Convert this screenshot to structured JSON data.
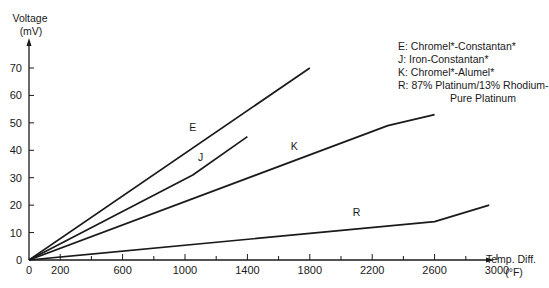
{
  "chart_data": {
    "type": "line",
    "title": "",
    "xlabel": "Temp. Diff. (°F)",
    "xlabel_line1": "Temp. Diff.",
    "xlabel_line2": "(°F)",
    "ylabel": "Voltage (mV)",
    "ylabel_line1": "Voltage",
    "ylabel_line2": "(mV)",
    "xlim": [
      0,
      3000
    ],
    "ylim": [
      0,
      70
    ],
    "x_ticks": [
      0,
      200,
      600,
      1000,
      1400,
      1800,
      2200,
      2600,
      3000
    ],
    "x_tick_labels": [
      "0",
      "200",
      "600",
      "1000",
      "1400",
      "1800",
      "2200",
      "2600",
      "3000"
    ],
    "x_minor_ticks": [
      200,
      400,
      600,
      800,
      1000,
      1200,
      1400,
      1600,
      1800,
      2000,
      2200,
      2400,
      2600,
      2800,
      3000
    ],
    "y_ticks": [
      0,
      10,
      20,
      30,
      40,
      50,
      60,
      70
    ],
    "y_tick_labels": [
      "0",
      "10",
      "20",
      "30",
      "40",
      "50",
      "60",
      "70"
    ],
    "grid": false,
    "legend_position": "upper right",
    "series": [
      {
        "name": "E",
        "label": "E",
        "description": "Chromel*-Constantan*",
        "x": [
          0,
          1800
        ],
        "y": [
          0,
          70
        ],
        "label_at": [
          1050,
          47
        ]
      },
      {
        "name": "J",
        "label": "J",
        "description": "Iron-Constantan*",
        "x": [
          0,
          1050,
          1400
        ],
        "y": [
          0,
          31,
          45
        ],
        "label_at": [
          1100,
          36
        ]
      },
      {
        "name": "K",
        "label": "K",
        "description": "Chromel*-Alumel*",
        "x": [
          0,
          2300,
          2600
        ],
        "y": [
          0,
          49,
          53
        ],
        "label_at": [
          1700,
          40
        ]
      },
      {
        "name": "R",
        "label": "R",
        "description": "87% Platinum/13% Rhodium-Pure Platinum",
        "x": [
          0,
          2600,
          2950
        ],
        "y": [
          0,
          14,
          20
        ],
        "label_at": [
          2100,
          16
        ]
      }
    ]
  },
  "legend": {
    "items": [
      {
        "text": "E: Chromel*-Constantan*"
      },
      {
        "text": "J: Iron-Constantan*"
      },
      {
        "text": "K: Chromel*-Alumel*"
      },
      {
        "text": "R: 87% Platinum/13% Rhodium-"
      }
    ],
    "continuation": "Pure Platinum"
  }
}
